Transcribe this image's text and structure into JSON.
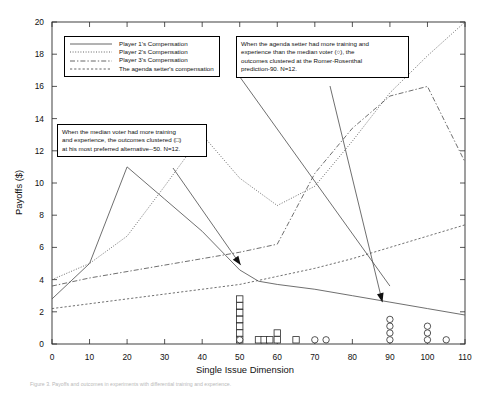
{
  "figure": {
    "caption": "Figure 3. Payoffs and outcomes in experiments with differential training and experience."
  },
  "chart_data": {
    "type": "line",
    "title": "",
    "xlabel": "Single Issue Dimension",
    "ylabel": "Payoffs ($)",
    "xlim": [
      0,
      110
    ],
    "ylim": [
      0,
      20
    ],
    "xticks": [
      0,
      10,
      20,
      30,
      40,
      50,
      60,
      70,
      80,
      90,
      100,
      110
    ],
    "yticks": [
      0,
      2,
      4,
      6,
      8,
      10,
      12,
      14,
      16,
      18,
      20
    ],
    "grid": false,
    "legend_position": "upper-left",
    "series": [
      {
        "name": "Player 1's Compensation",
        "style": "solid",
        "x": [
          0,
          10,
          20,
          30,
          40,
          50,
          55,
          60,
          70,
          80,
          90,
          100,
          110
        ],
        "y": [
          2.8,
          5.0,
          11.0,
          9.0,
          7.0,
          4.6,
          3.9,
          3.7,
          3.4,
          3.0,
          2.6,
          2.2,
          1.8
        ]
      },
      {
        "name": "Player 2's Compensation",
        "style": "dotted",
        "x": [
          0,
          10,
          20,
          30,
          40,
          50,
          60,
          70,
          80,
          90,
          100,
          110
        ],
        "y": [
          4.0,
          5.0,
          6.7,
          9.8,
          13.0,
          10.3,
          8.6,
          9.8,
          12.6,
          15.6,
          17.9,
          20.0
        ]
      },
      {
        "name": "Player 3's Compensation",
        "style": "dashdot",
        "x": [
          0,
          10,
          20,
          30,
          40,
          50,
          60,
          70,
          80,
          90,
          100,
          110
        ],
        "y": [
          3.6,
          4.1,
          4.5,
          4.9,
          5.3,
          5.7,
          6.2,
          10.6,
          13.4,
          15.4,
          16.0,
          11.3
        ]
      },
      {
        "name": "The agenda setter's compensation",
        "style": "dashed",
        "x": [
          0,
          10,
          20,
          30,
          40,
          50,
          60,
          70,
          80,
          90,
          100,
          110
        ],
        "y": [
          2.2,
          2.5,
          2.8,
          3.1,
          3.4,
          3.7,
          4.2,
          4.7,
          5.3,
          6.0,
          6.7,
          7.4
        ]
      },
      {
        "name": "Agenda setter line (steep)",
        "style": "solid",
        "x": [
          50,
          90
        ],
        "y": [
          16.6,
          3.6
        ]
      }
    ],
    "outcome_markers": [
      {
        "marker": "square",
        "x": 50,
        "counts": 7,
        "label": "median voter outcomes clustered at 50"
      },
      {
        "marker": "square",
        "x": 55,
        "counts": 1
      },
      {
        "marker": "square",
        "x": 56.5,
        "counts": 1
      },
      {
        "marker": "square",
        "x": 58,
        "counts": 1
      },
      {
        "marker": "square",
        "x": 60,
        "counts": 2
      },
      {
        "marker": "square",
        "x": 65,
        "counts": 1
      },
      {
        "marker": "circle",
        "x": 50,
        "counts": 1
      },
      {
        "marker": "circle",
        "x": 70,
        "counts": 1
      },
      {
        "marker": "circle",
        "x": 73,
        "counts": 1
      },
      {
        "marker": "circle",
        "x": 90,
        "counts": 4
      },
      {
        "marker": "circle",
        "x": 100,
        "counts": 3
      },
      {
        "marker": "circle",
        "x": 105,
        "counts": 1
      }
    ],
    "annotations": [
      {
        "id": "median-voter-note",
        "text": "When the median voter had more training and experience, the outcomes clustered (□) at his most preferred alternative--50. N=12.",
        "lines": [
          "When the median voter had more training",
          "and experience, the outcomes clustered (□)",
          "at his most preferred alternative--50. N=12."
        ],
        "points_to_x": 50,
        "points_to_y": 4
      },
      {
        "id": "agenda-setter-note",
        "text": "When the agenda setter had more training and experience than the median voter (○), the outcomes clustered at the Romer-Rosenthal prediction-90.  N=12.",
        "lines": [
          "When the agenda setter had more training and",
          "experience than the median voter (○), the",
          "outcomes clustered at the Romer-Rosenthal",
          "prediction-90.  N=12."
        ],
        "points_to_x": 90,
        "points_to_y": 3
      }
    ],
    "legend": [
      {
        "label": "Player 1's Compensation",
        "style": "solid"
      },
      {
        "label": "Player 2's Compensation",
        "style": "dotted"
      },
      {
        "label": "Player 3's Compensation",
        "style": "dashdot"
      },
      {
        "label": "The agenda setter's compensation",
        "style": "dashed"
      }
    ]
  }
}
